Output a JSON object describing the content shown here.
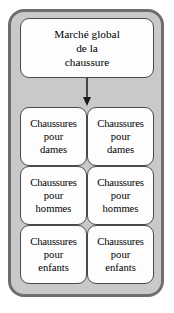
{
  "diagram": {
    "type": "tree-hierarchy",
    "colors": {
      "frame_border": "#6e6e6e",
      "frame_fill": "#c9c9c9",
      "node_fill": "#fdfdfd",
      "node_border": "#4a4a4a",
      "text": "#000000",
      "connector": "#1a1a1a"
    },
    "root": {
      "lines": [
        "Marché global",
        "de la",
        "chaussure"
      ]
    },
    "connector": {
      "icon": "down-arrow-icon"
    },
    "leaves": [
      {
        "lines": [
          "Chaussures",
          "pour",
          "dames"
        ]
      },
      {
        "lines": [
          "Chaussures",
          "pour",
          "dames"
        ]
      },
      {
        "lines": [
          "Chaussures",
          "pour",
          "hommes"
        ]
      },
      {
        "lines": [
          "Chaussures",
          "pour",
          "hommes"
        ]
      },
      {
        "lines": [
          "Chaussures",
          "pour",
          "enfants"
        ]
      },
      {
        "lines": [
          "Chaussures",
          "pour",
          "enfants"
        ]
      }
    ]
  }
}
